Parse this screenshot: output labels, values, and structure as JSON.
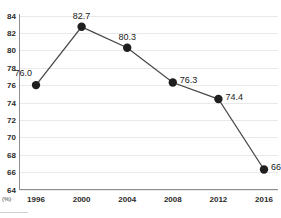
{
  "chart_data": {
    "type": "line",
    "title": "",
    "subtitle": "",
    "xlabel": "",
    "ylabel": "",
    "unit_label": "(%)",
    "categories": [
      "1996",
      "2000",
      "2004",
      "2008",
      "2012",
      "2016"
    ],
    "values": [
      76.0,
      82.7,
      80.3,
      76.3,
      74.4,
      66.3
    ],
    "point_labels": [
      "76.0",
      "82.7",
      "80.3",
      "76.3",
      "74.4",
      "66.3"
    ],
    "label_positions": [
      "above-left",
      "above",
      "above",
      "right",
      "right",
      "right"
    ],
    "series": [
      {
        "name": "",
        "values": [
          76.0,
          82.7,
          80.3,
          76.3,
          74.4,
          66.3
        ]
      }
    ],
    "ylim": [
      64,
      84
    ],
    "ytick_step": 2,
    "ytick_labels": [
      "84",
      "82",
      "80",
      "78",
      "76",
      "74",
      "72",
      "70",
      "68",
      "66",
      "64"
    ],
    "ytick_values": [
      84,
      82,
      80,
      78,
      76,
      74,
      72,
      70,
      68,
      66,
      64
    ],
    "grid": true,
    "grid_axis": "y",
    "legend": false,
    "legend_position": "none",
    "marker": "circle",
    "colors": {
      "line": "#4a4a4a",
      "marker": "#1f1f1f",
      "grid": "#e9e9e9",
      "axis": "#8e8e8e",
      "tick_label": "#2b2b2b",
      "value_label": "#1a1a1a",
      "background": "#ffffff"
    }
  }
}
